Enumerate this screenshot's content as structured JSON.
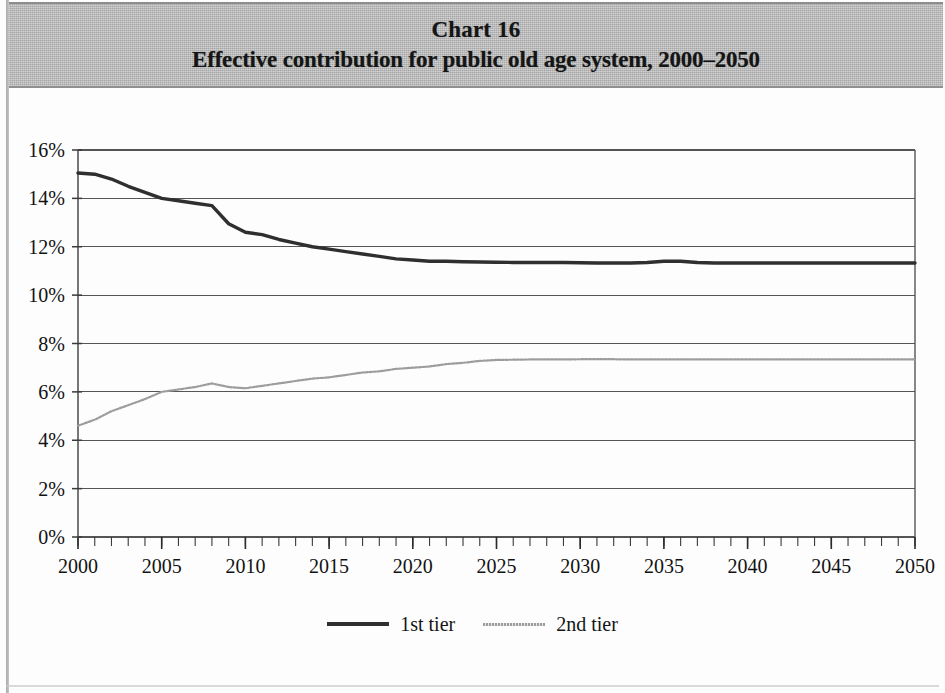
{
  "header": {
    "chart_number": "Chart 16",
    "title": "Effective contribution for public old age system, 2000–2050"
  },
  "legend": {
    "items": [
      {
        "label": "1st tier",
        "style": "solid-thick",
        "color": "#2f2f2f"
      },
      {
        "label": "2nd tier",
        "style": "dotted-thin",
        "color": "#9d9d9d"
      }
    ]
  },
  "chart_data": {
    "type": "line",
    "title": "Effective contribution for public old age system, 2000–2050",
    "subtitle": "Chart 16",
    "xlabel": "",
    "ylabel": "",
    "xlim": [
      2000,
      2050
    ],
    "ylim": [
      0,
      16
    ],
    "xticks": [
      2000,
      2005,
      2010,
      2015,
      2020,
      2025,
      2030,
      2035,
      2040,
      2045,
      2050
    ],
    "xtick_labels": [
      "2000",
      "2005",
      "2010",
      "2015",
      "2020",
      "2025",
      "2030",
      "2035",
      "2040",
      "2045",
      "2050"
    ],
    "x_minor_tick_step": 1,
    "yticks": [
      0,
      2,
      4,
      6,
      8,
      10,
      12,
      14,
      16
    ],
    "ytick_labels": [
      "0%",
      "2%",
      "4%",
      "6%",
      "8%",
      "10%",
      "12%",
      "14%",
      "16%"
    ],
    "grid": "horizontal",
    "legend_position": "bottom-center",
    "x": [
      2000,
      2001,
      2002,
      2003,
      2004,
      2005,
      2006,
      2007,
      2008,
      2009,
      2010,
      2011,
      2012,
      2013,
      2014,
      2015,
      2016,
      2017,
      2018,
      2019,
      2020,
      2021,
      2022,
      2023,
      2024,
      2025,
      2026,
      2027,
      2028,
      2029,
      2030,
      2031,
      2032,
      2033,
      2034,
      2035,
      2036,
      2037,
      2038,
      2039,
      2040,
      2041,
      2042,
      2043,
      2044,
      2045,
      2046,
      2047,
      2048,
      2049,
      2050
    ],
    "series": [
      {
        "name": "1st tier",
        "color": "#2f2f2f",
        "style": "solid-thick",
        "values": [
          15.05,
          15.0,
          14.8,
          14.5,
          14.25,
          14.0,
          13.9,
          13.8,
          13.7,
          12.95,
          12.6,
          12.5,
          12.3,
          12.15,
          12.0,
          11.9,
          11.8,
          11.7,
          11.6,
          11.5,
          11.45,
          11.4,
          11.4,
          11.38,
          11.37,
          11.36,
          11.35,
          11.35,
          11.35,
          11.35,
          11.34,
          11.33,
          11.33,
          11.33,
          11.35,
          11.4,
          11.4,
          11.35,
          11.33,
          11.33,
          11.33,
          11.33,
          11.33,
          11.33,
          11.33,
          11.33,
          11.33,
          11.33,
          11.33,
          11.33,
          11.33
        ]
      },
      {
        "name": "2nd tier",
        "color": "#9d9d9d",
        "style": "dotted-thin",
        "values": [
          4.6,
          4.85,
          5.2,
          5.45,
          5.7,
          6.0,
          6.1,
          6.2,
          6.35,
          6.2,
          6.15,
          6.25,
          6.35,
          6.45,
          6.55,
          6.6,
          6.7,
          6.8,
          6.85,
          6.95,
          7.0,
          7.05,
          7.15,
          7.2,
          7.28,
          7.32,
          7.33,
          7.34,
          7.34,
          7.34,
          7.35,
          7.35,
          7.35,
          7.34,
          7.34,
          7.34,
          7.34,
          7.34,
          7.34,
          7.34,
          7.34,
          7.34,
          7.34,
          7.34,
          7.34,
          7.34,
          7.34,
          7.34,
          7.34,
          7.34,
          7.34
        ]
      }
    ]
  }
}
